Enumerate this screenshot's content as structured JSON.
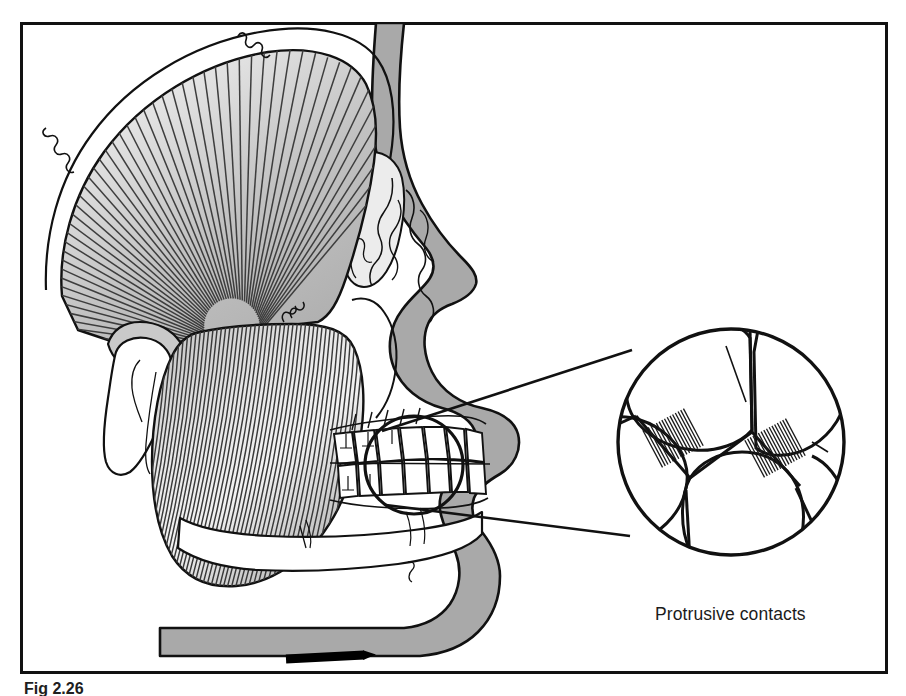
{
  "figure": {
    "caption": "Protrusive contacts",
    "figure_number": "Fig 2.26",
    "frame": {
      "x": 20,
      "y": 22,
      "width": 868,
      "height": 652,
      "stroke_color": "#111111",
      "stroke_width": 3,
      "background": "#ffffff"
    }
  },
  "colors": {
    "outline": "#111111",
    "soft_tissue_gray": "#a9a9a9",
    "muscle_gray": "#b4b4b4",
    "muscle_gray_light": "#d8d8d8",
    "bone_white": "#ffffff",
    "orbit_gray": "#ececec",
    "fiber_line": "#3a3a3a",
    "arrow_black": "#000000",
    "text": "#1b1b1b"
  },
  "anatomy": {
    "temporalis": {
      "name": "temporalis-muscle",
      "fiber_count": 54,
      "description": "fan-shaped radiating fibers converging to coronoid insertion"
    },
    "masseter": {
      "name": "masseter-muscle",
      "fiber_count": 48,
      "description": "diagonal striated fibers from zygomatic arch to mandibular angle"
    },
    "condyle": {
      "name": "mandibular-condyle"
    },
    "orbit": {
      "name": "orbital-cavity"
    },
    "nose": {
      "name": "nasal-profile"
    },
    "maxilla_teeth": {
      "name": "upper-dental-arch",
      "tooth_count": 8
    },
    "mandible_teeth": {
      "name": "lower-dental-arch",
      "tooth_count": 8
    },
    "mandible": {
      "name": "mandible-body"
    },
    "soft_tissue_profile": {
      "name": "facial-soft-tissue-profile"
    }
  },
  "callout": {
    "small_circle": {
      "cx": 414,
      "cy": 465,
      "r": 49
    },
    "magnified_circle": {
      "cx": 731,
      "cy": 442,
      "r": 113
    },
    "leader_lines": 2,
    "contacts": [
      {
        "id": "contact-left",
        "hatch_lines": 16,
        "angle": -28
      },
      {
        "id": "contact-right",
        "hatch_lines": 16,
        "angle": -28
      }
    ]
  },
  "movement_arrow": {
    "name": "protrusive-direction-arrow",
    "direction": "right",
    "x1": 286,
    "y1": 657,
    "x2": 376,
    "y2": 657,
    "label": ""
  }
}
